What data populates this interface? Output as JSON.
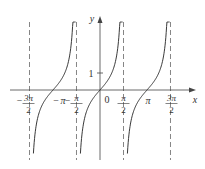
{
  "chart_data": {
    "type": "line",
    "title": "",
    "function": "y = tan x",
    "xlabel": "x",
    "ylabel": "y",
    "x_ticks": [
      {
        "value": -4.712,
        "label": "-3π/2",
        "num": "3π",
        "den": "2",
        "neg": true
      },
      {
        "value": -3.1416,
        "label": "-π",
        "text": "π",
        "neg": true
      },
      {
        "value": -1.5708,
        "label": "-π/2",
        "num": "π",
        "den": "2",
        "neg": true
      },
      {
        "value": 0,
        "label": "0"
      },
      {
        "value": 1.5708,
        "label": "π/2",
        "num": "π",
        "den": "2",
        "neg": false
      },
      {
        "value": 3.1416,
        "label": "π",
        "text": "π",
        "neg": false
      },
      {
        "value": 4.712,
        "label": "3π/2",
        "num": "3π",
        "den": "2",
        "neg": false
      }
    ],
    "y_ticks": [
      {
        "value": 1,
        "label": "1"
      }
    ],
    "asymptotes": [
      -4.712,
      -1.5708,
      1.5708,
      4.712
    ],
    "branches": [
      {
        "center": -3.1416,
        "domain": [
          -4.712,
          -1.5708
        ]
      },
      {
        "center": 0,
        "domain": [
          -1.5708,
          1.5708
        ]
      },
      {
        "center": 3.1416,
        "domain": [
          1.5708,
          4.712
        ]
      }
    ],
    "xlim": [
      -5.5,
      5.6
    ],
    "ylim": [
      -4.1,
      4.0
    ],
    "grid": false,
    "legend": null
  },
  "labels": {
    "origin": "0",
    "y_tick_one": "1",
    "x_axis": "x",
    "y_axis": "y",
    "minus": "−",
    "pi": "π",
    "three_pi": "3π",
    "two": "2"
  },
  "colors": {
    "curve": "#222222",
    "axis": "#444444",
    "asymptote": "#666666",
    "text": "#333333"
  }
}
